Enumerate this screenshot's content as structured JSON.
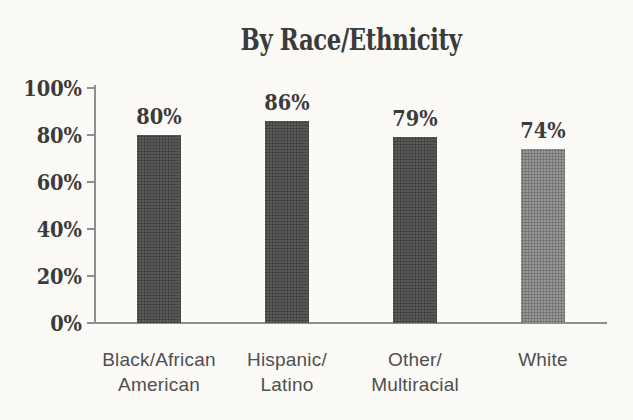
{
  "chart_data": {
    "type": "bar",
    "title": "By Race/Ethnicity",
    "categories": [
      "Black/African\nAmerican",
      "Hispanic/\nLatino",
      "Other/\nMultiracial",
      "White"
    ],
    "values": [
      80,
      86,
      79,
      74
    ],
    "value_labels": [
      "80%",
      "86%",
      "79%",
      "74%"
    ],
    "bar_colors": [
      "#4f4f4f",
      "#4f4f4f",
      "#4f4f4f",
      "#8f8f8f"
    ],
    "yticks": [
      {
        "label": "100%",
        "value": 100
      },
      {
        "label": "80%",
        "value": 80
      },
      {
        "label": "60%",
        "value": 60
      },
      {
        "label": "40%",
        "value": 40
      },
      {
        "label": "20%",
        "value": 20
      },
      {
        "label": "0%",
        "value": 0
      }
    ],
    "ylim": [
      0,
      100
    ],
    "xlabel": "",
    "ylabel": "",
    "grid": false,
    "legend": null
  },
  "colors": {
    "background": "#fbfaf7",
    "bar_dark": "#4f4f4f",
    "bar_light": "#8f8f8f",
    "axis": "#8f8f8f",
    "text_dark": "#3b3b3b",
    "text_category": "#4f4f4f"
  }
}
